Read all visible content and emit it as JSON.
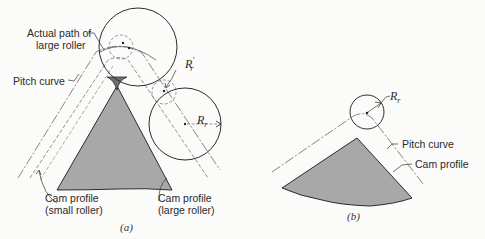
{
  "figure_a": {
    "caption": "(a)",
    "labels": {
      "actual_path_line1": "Actual path of",
      "actual_path_line2": "large roller",
      "pitch_curve": "Pitch curve",
      "cam_profile_small_line1": "Cam profile",
      "cam_profile_small_line2": "(small roller)",
      "cam_profile_large_line1": "Cam profile",
      "cam_profile_large_line2": "(large roller)"
    },
    "symbols": {
      "small_roller_radius": "R",
      "small_roller_radius_sub": "r",
      "small_roller_radius_prime": "′",
      "large_roller_radius": "R",
      "large_roller_radius_sub": "r"
    }
  },
  "figure_b": {
    "caption": "(b)",
    "labels": {
      "pitch_curve": "Pitch curve",
      "cam_profile": "Cam profile"
    },
    "symbols": {
      "roller_radius": "R",
      "roller_radius_sub": "r"
    }
  },
  "colors": {
    "cam_fill": "#a9a9a9",
    "line": "#2b2b2b",
    "dashed": "#777777"
  }
}
